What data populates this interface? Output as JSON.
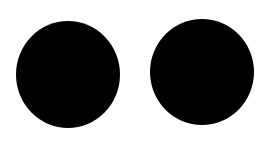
{
  "background": "#ffffff",
  "shapes": [
    {
      "name": "left-circle",
      "color": "#000000",
      "x": 16,
      "y": 21,
      "w": 104,
      "h": 107
    },
    {
      "name": "right-circle",
      "color": "#000000",
      "x": 150,
      "y": 19,
      "w": 104,
      "h": 106
    }
  ]
}
